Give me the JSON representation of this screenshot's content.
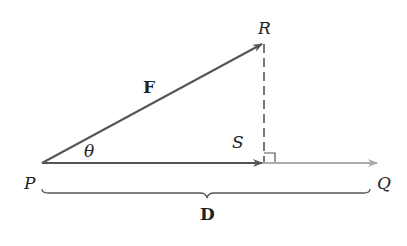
{
  "diagram": {
    "type": "vector-projection",
    "points": {
      "P": {
        "label": "P",
        "x": 42,
        "y": 163
      },
      "R": {
        "label": "R",
        "x": 263,
        "y": 45
      },
      "S": {
        "label": "S",
        "x": 263,
        "y": 163
      },
      "Q": {
        "label": "Q",
        "x": 378,
        "y": 163
      }
    },
    "vectors": {
      "F": {
        "label": "F",
        "from": "P",
        "to": "R"
      },
      "D": {
        "label": "D",
        "from": "P",
        "to": "Q"
      }
    },
    "angle": {
      "label": "θ"
    },
    "colors": {
      "vector_dark": "#555555",
      "vector_light": "#aaaaaa",
      "text": "#222222"
    }
  }
}
